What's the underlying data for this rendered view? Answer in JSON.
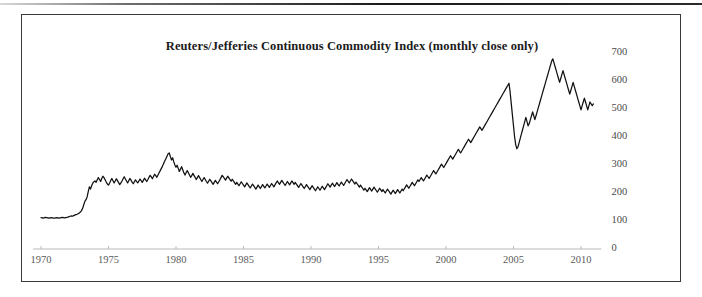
{
  "figure": {
    "title": "Reuters/Jefferies Continuous Commodity Index (monthly close only)",
    "line_color": "#111111",
    "axis_color": "#b9b9b9",
    "frame_color": "#3a3a3a",
    "label_color": "#4a4a4a"
  },
  "chart_data": {
    "type": "line",
    "title": "Reuters/Jefferies Continuous Commodity Index (monthly close only)",
    "xlabel": "",
    "ylabel": "",
    "grid": false,
    "legend": null,
    "y_axis_side": "right",
    "xlim": [
      1970,
      1970
    ],
    "ylim": [
      0,
      700
    ],
    "yticks": [
      0,
      100,
      200,
      300,
      400,
      500,
      600,
      700
    ],
    "ytick_labels": [
      "0",
      "100",
      "200",
      "300",
      "400",
      "500",
      "600",
      "700"
    ],
    "xticks": [
      1970,
      1975,
      1980,
      1985,
      1990,
      1995,
      2000,
      2005,
      2010
    ],
    "xtick_labels": [
      "1970",
      "1975",
      "1980",
      "1985",
      "1990",
      "1995",
      "2000",
      "2005",
      "2010"
    ],
    "x_start": 1970.0,
    "x_step_years": 0.08333333,
    "series": [
      {
        "name": "Reuters/Jefferies CRB Continuous Commodity Index",
        "values": [
          112,
          111,
          110,
          112,
          113,
          112,
          111,
          110,
          111,
          112,
          111,
          110,
          110,
          111,
          112,
          111,
          110,
          111,
          112,
          113,
          112,
          111,
          112,
          113,
          114,
          116,
          117,
          118,
          117,
          119,
          121,
          123,
          124,
          126,
          128,
          132,
          137,
          145,
          158,
          170,
          176,
          186,
          205,
          222,
          214,
          226,
          235,
          240,
          243,
          238,
          247,
          255,
          248,
          241,
          252,
          260,
          255,
          247,
          239,
          232,
          228,
          236,
          245,
          252,
          244,
          236,
          243,
          251,
          244,
          237,
          230,
          236,
          243,
          251,
          258,
          250,
          243,
          236,
          244,
          252,
          246,
          239,
          233,
          240,
          247,
          241,
          236,
          243,
          250,
          244,
          238,
          245,
          253,
          247,
          241,
          248,
          256,
          263,
          258,
          251,
          259,
          267,
          262,
          256,
          264,
          272,
          280,
          288,
          296,
          305,
          314,
          322,
          331,
          340,
          343,
          330,
          318,
          326,
          312,
          300,
          292,
          299,
          288,
          277,
          286,
          294,
          283,
          272,
          264,
          272,
          280,
          272,
          264,
          256,
          262,
          270,
          263,
          256,
          248,
          255,
          262,
          255,
          248,
          241,
          248,
          255,
          248,
          241,
          235,
          242,
          249,
          243,
          237,
          231,
          238,
          245,
          239,
          233,
          240,
          247,
          255,
          263,
          258,
          252,
          246,
          253,
          260,
          254,
          248,
          242,
          249,
          243,
          237,
          231,
          238,
          232,
          226,
          233,
          240,
          234,
          228,
          222,
          229,
          236,
          230,
          224,
          218,
          225,
          232,
          226,
          220,
          214,
          221,
          228,
          222,
          216,
          223,
          230,
          224,
          218,
          225,
          232,
          226,
          220,
          227,
          234,
          228,
          222,
          229,
          236,
          243,
          237,
          231,
          238,
          245,
          239,
          233,
          227,
          234,
          241,
          235,
          229,
          236,
          243,
          237,
          231,
          238,
          232,
          226,
          220,
          227,
          234,
          228,
          222,
          216,
          223,
          230,
          224,
          218,
          212,
          219,
          226,
          220,
          214,
          208,
          215,
          222,
          216,
          210,
          217,
          224,
          218,
          212,
          219,
          226,
          233,
          227,
          221,
          228,
          235,
          229,
          223,
          230,
          237,
          231,
          225,
          232,
          239,
          233,
          227,
          234,
          241,
          248,
          242,
          236,
          243,
          250,
          244,
          238,
          232,
          239,
          233,
          227,
          221,
          228,
          222,
          216,
          210,
          217,
          211,
          205,
          212,
          219,
          213,
          207,
          214,
          221,
          215,
          209,
          203,
          210,
          217,
          211,
          205,
          212,
          206,
          200,
          207,
          214,
          208,
          202,
          196,
          203,
          210,
          204,
          198,
          205,
          212,
          206,
          200,
          207,
          214,
          208,
          215,
          222,
          229,
          223,
          217,
          224,
          231,
          238,
          232,
          226,
          233,
          240,
          247,
          241,
          248,
          255,
          249,
          243,
          250,
          257,
          264,
          258,
          252,
          259,
          266,
          273,
          280,
          274,
          268,
          275,
          282,
          289,
          296,
          303,
          297,
          291,
          298,
          305,
          312,
          319,
          326,
          333,
          327,
          321,
          328,
          335,
          342,
          349,
          356,
          349,
          343,
          350,
          357,
          364,
          371,
          378,
          385,
          392,
          386,
          380,
          387,
          394,
          401,
          408,
          415,
          422,
          429,
          436,
          430,
          424,
          431,
          438,
          445,
          452,
          459,
          466,
          473,
          480,
          487,
          494,
          501,
          508,
          515,
          522,
          529,
          536,
          543,
          550,
          557,
          564,
          571,
          578,
          585,
          592,
          560,
          520,
          480,
          440,
          400,
          372,
          358,
          365,
          380,
          395,
          410,
          425,
          440,
          455,
          470,
          455,
          440,
          448,
          462,
          476,
          490,
          476,
          462,
          476,
          490,
          504,
          518,
          532,
          546,
          560,
          574,
          588,
          602,
          616,
          630,
          644,
          658,
          672,
          679,
          665,
          651,
          637,
          623,
          609,
          595,
          609,
          623,
          637,
          623,
          609,
          595,
          581,
          567,
          553,
          567,
          581,
          595,
          581,
          567,
          553,
          539,
          525,
          511,
          497,
          511,
          525,
          539,
          525,
          511,
          497,
          511,
          525,
          518,
          512,
          518
        ]
      }
    ],
    "annotations": {
      "peak_1980": {
        "approx_value": 343,
        "approx_year": 1980.5
      },
      "peak_2008": {
        "approx_value": 592,
        "approx_year": 2008.4
      },
      "trough_2008": {
        "approx_value": 358,
        "approx_year": 2008.9
      },
      "peak_2011": {
        "approx_value": 679,
        "approx_year": 2011.3
      },
      "end_value": 518
    }
  },
  "axis_labels": {
    "y": [
      {
        "text": "700",
        "value": 700
      },
      {
        "text": "600",
        "value": 600
      },
      {
        "text": "500",
        "value": 500
      },
      {
        "text": "400",
        "value": 400
      },
      {
        "text": "300",
        "value": 300
      },
      {
        "text": "200",
        "value": 200
      },
      {
        "text": "100",
        "value": 100
      },
      {
        "text": "0",
        "value": 0
      }
    ],
    "x": [
      {
        "text": "1970",
        "value": 1970
      },
      {
        "text": "1975",
        "value": 1975
      },
      {
        "text": "1980",
        "value": 1980
      },
      {
        "text": "1985",
        "value": 1985
      },
      {
        "text": "1990",
        "value": 1990
      },
      {
        "text": "1995",
        "value": 1995
      },
      {
        "text": "2000",
        "value": 2000
      },
      {
        "text": "2005",
        "value": 2005
      },
      {
        "text": "2010",
        "value": 2010
      }
    ]
  }
}
